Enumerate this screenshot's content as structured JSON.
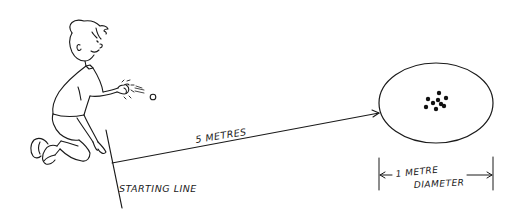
{
  "diagram": {
    "labels": {
      "distance": "5 METRES",
      "starting_line": "STARTING LINE",
      "diameter_line1": "1 METRE",
      "diameter_line2": "DIAMETER"
    },
    "colors": {
      "ink": "#1a1a1a",
      "background": "#ffffff"
    },
    "target": {
      "shape": "circle (drawn in perspective as ellipse)",
      "dot_count": 9
    }
  }
}
